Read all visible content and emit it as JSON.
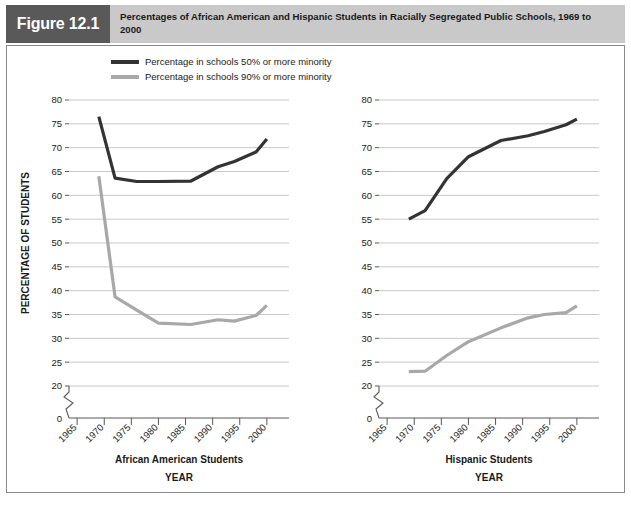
{
  "figure": {
    "badge": "Figure 12.1",
    "title": "Percentages of African American and Hispanic Students in Racially Segregated Public Schools, 1969 to 2000"
  },
  "legend": {
    "position": "top-left",
    "items": [
      {
        "label": "Percentage in schools 50% or more minority",
        "color": "#333333"
      },
      {
        "label": "Percentage in schools 90% or more minority",
        "color": "#a8a8a8"
      }
    ]
  },
  "axis": {
    "ylabel": "PERCENTAGE OF STUDENTS",
    "xlabel": "YEAR",
    "ytick_labels": [
      "80",
      "75",
      "70",
      "65",
      "60",
      "55",
      "50",
      "45",
      "40",
      "35",
      "30",
      "25",
      "20",
      "0"
    ],
    "xtick_labels": [
      "1965",
      "1970",
      "1975",
      "1980",
      "1985",
      "1990",
      "1995",
      "2000"
    ],
    "ymin": 20,
    "ymax": 80,
    "ystep": 5,
    "xmin": 1963.5,
    "xmax": 2001.5,
    "axis_break": true,
    "grid": true
  },
  "chart_data": [
    {
      "type": "line",
      "panel": "left",
      "title": "African American Students",
      "xlabel": "YEAR",
      "ylabel": "PERCENTAGE OF STUDENTS",
      "xlim": [
        1963.5,
        2001.5
      ],
      "ylim": [
        20,
        80
      ],
      "grid": true,
      "legend_position": "top-left",
      "x": [
        1969,
        1972,
        1976,
        1980,
        1986,
        1991,
        1994,
        1998,
        2000
      ],
      "series": [
        {
          "name": "Percentage in schools 50% or more minority",
          "color": "#333333",
          "values": [
            76.5,
            63.6,
            62.9,
            62.9,
            63.0,
            66.0,
            67.1,
            69.1,
            71.8
          ]
        },
        {
          "name": "Percentage in schools 90% or more minority",
          "color": "#a8a8a8",
          "values": [
            64.0,
            38.7,
            35.9,
            33.2,
            32.9,
            33.9,
            33.6,
            34.8,
            36.9
          ]
        }
      ]
    },
    {
      "type": "line",
      "panel": "right",
      "title": "Hispanic Students",
      "xlabel": "YEAR",
      "ylabel": "PERCENTAGE OF STUDENTS",
      "xlim": [
        1963.5,
        2001.5
      ],
      "ylim": [
        20,
        80
      ],
      "grid": true,
      "legend_position": "top-left",
      "x": [
        1969,
        1972,
        1976,
        1980,
        1986,
        1991,
        1994,
        1998,
        2000
      ],
      "series": [
        {
          "name": "Percentage in schools 50% or more minority",
          "color": "#333333",
          "values": [
            55.0,
            56.8,
            63.5,
            68.1,
            71.5,
            72.5,
            73.4,
            74.8,
            76.0
          ]
        },
        {
          "name": "Percentage in schools 90% or more minority",
          "color": "#a8a8a8",
          "values": [
            23.0,
            23.1,
            26.4,
            29.3,
            32.2,
            34.3,
            35.0,
            35.4,
            36.8
          ]
        }
      ]
    }
  ]
}
